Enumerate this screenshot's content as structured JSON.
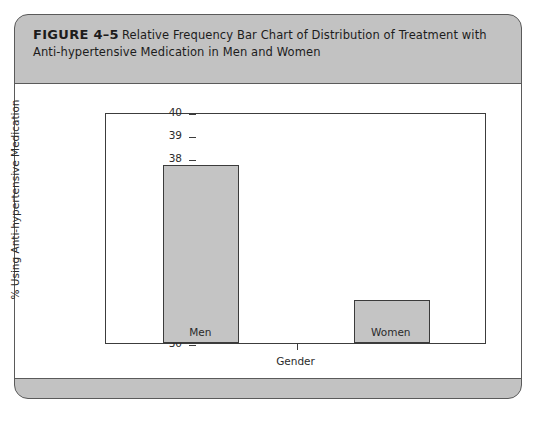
{
  "figure": {
    "number_label": "FIGURE 4–5",
    "caption": "Relative Frequency Bar Chart of Distribution of Treatment with Anti-hypertensive Medication in Men and Women"
  },
  "colors": {
    "panel_gray": "#c2c2c2",
    "panel_border": "#5a5a5a",
    "bar_fill": "#c4c4c4",
    "bar_border": "#3b3b3b",
    "axis": "#3c3c3c",
    "text": "#2b2b2b",
    "plot_background": "#ffffff"
  },
  "chart_data": {
    "type": "bar",
    "title": "",
    "categories": [
      "Men",
      "Women"
    ],
    "values": [
      37.7,
      31.85
    ],
    "series": [
      {
        "name": "% Using Anti-hypertensive Medication",
        "values": [
          37.7,
          31.85
        ]
      }
    ],
    "xlabel": "Gender",
    "ylabel": "% Using Anti-hypertensive Medication",
    "ylim": [
      30,
      40
    ],
    "ytick_interval": 1,
    "yticks": [
      40,
      39,
      38,
      37,
      36,
      35,
      34,
      33,
      32,
      31,
      30
    ],
    "ytick_labels": [
      "40",
      "39",
      "38",
      "37",
      "36",
      "35",
      "34",
      "33",
      "32",
      "31",
      "30"
    ],
    "grid": false,
    "legend": false,
    "legend_position": "none"
  }
}
